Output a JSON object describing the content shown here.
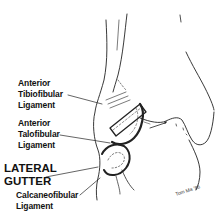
{
  "figure": {
    "labels": {
      "anterior_tibiofibular": [
        "Anterior",
        "Tibiofibular",
        "Ligament"
      ],
      "anterior_talofibular": [
        "Anterior",
        "Talofibular",
        "Ligament"
      ],
      "lateral_gutter": [
        "LATERAL",
        "GUTTER"
      ],
      "calcaneofibular": [
        "Calcaneofibular",
        "Ligament"
      ]
    },
    "signature": "Tom Ma '86",
    "colors": {
      "ink": "#111111",
      "background": "#ffffff"
    }
  }
}
